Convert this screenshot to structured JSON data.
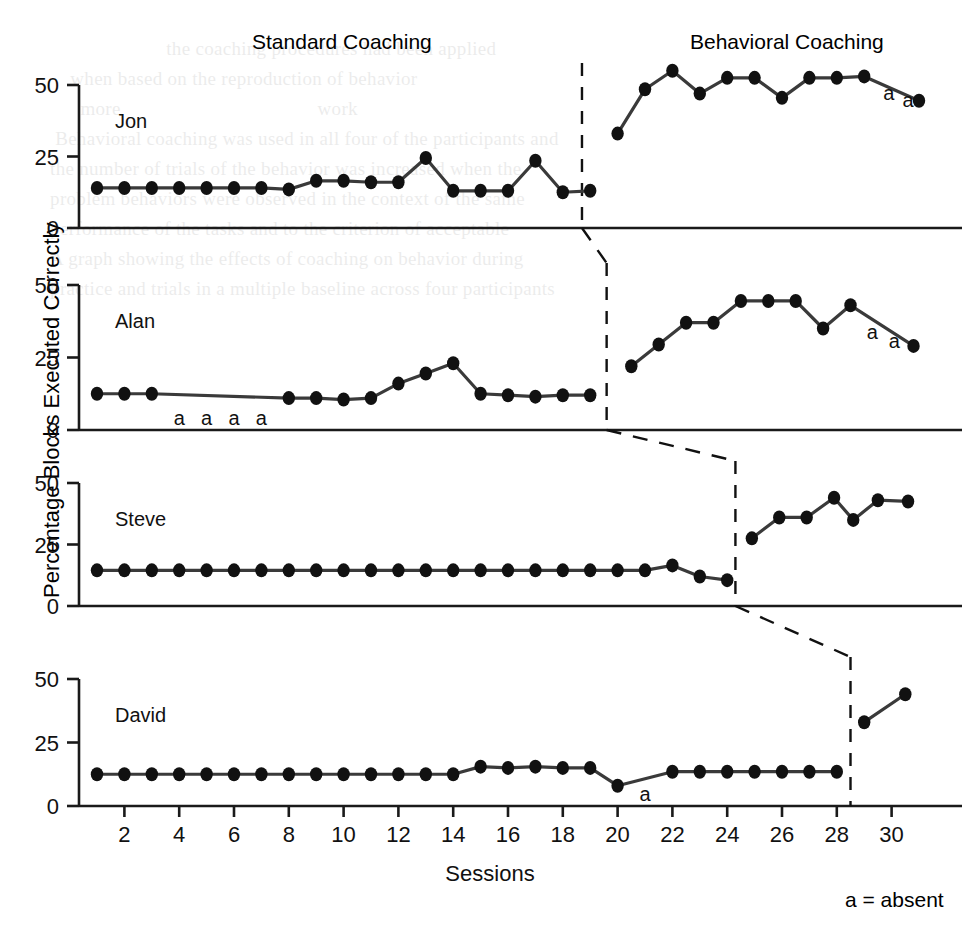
{
  "figure": {
    "phase_labels": [
      {
        "text": "Standard Coaching",
        "x": 310,
        "y": 42
      },
      {
        "text": "Behavioral Coaching",
        "x": 700,
        "y": 42
      }
    ],
    "y_axis_title": "Percentage Blocks Executed Correctly",
    "x_axis_title": "Sessions",
    "legend_note": "a = absent",
    "absent_glyph": "a"
  },
  "chart_data": {
    "type": "line",
    "subtitle": "Multiple-baseline design: Standard Coaching vs Behavioral Coaching",
    "xlabel": "Sessions",
    "ylabel": "Percentage Blocks Executed Correctly",
    "xlim": [
      1,
      31
    ],
    "ylim": [
      0,
      57
    ],
    "yticks": [
      0,
      25,
      50
    ],
    "xticks": [
      2,
      4,
      6,
      8,
      10,
      12,
      14,
      16,
      18,
      20,
      22,
      24,
      26,
      28,
      30
    ],
    "grid": false,
    "legend_position": "bottom-right",
    "annotations": [
      {
        "label": "Standard Coaching",
        "phase": "baseline"
      },
      {
        "label": "Behavioral Coaching",
        "phase": "intervention"
      },
      {
        "label": "a = absent",
        "meaning": "session missed due to absence"
      }
    ],
    "panels": [
      {
        "name": "Jon",
        "phase_line_session": 18.7,
        "series": [
          {
            "name": "Standard Coaching",
            "points": [
              {
                "x": 1,
                "y": 14
              },
              {
                "x": 2,
                "y": 14
              },
              {
                "x": 3,
                "y": 14
              },
              {
                "x": 4,
                "y": 14
              },
              {
                "x": 5,
                "y": 14
              },
              {
                "x": 6,
                "y": 14
              },
              {
                "x": 7,
                "y": 14
              },
              {
                "x": 8,
                "y": 13.5
              },
              {
                "x": 9,
                "y": 16.5
              },
              {
                "x": 10,
                "y": 16.5
              },
              {
                "x": 11,
                "y": 16
              },
              {
                "x": 12,
                "y": 16
              },
              {
                "x": 13,
                "y": 24.5
              },
              {
                "x": 14,
                "y": 13
              },
              {
                "x": 15,
                "y": 13
              },
              {
                "x": 16,
                "y": 13
              },
              {
                "x": 17,
                "y": 23.5
              },
              {
                "x": 18,
                "y": 12.5
              },
              {
                "x": 19,
                "y": 13
              }
            ]
          },
          {
            "name": "Behavioral Coaching",
            "points": [
              {
                "x": 20,
                "y": 33
              },
              {
                "x": 21,
                "y": 48.5
              },
              {
                "x": 22,
                "y": 55
              },
              {
                "x": 23,
                "y": 47
              },
              {
                "x": 24,
                "y": 52.5
              },
              {
                "x": 25,
                "y": 52.5
              },
              {
                "x": 26,
                "y": 45.5
              },
              {
                "x": 27,
                "y": 52.5
              },
              {
                "x": 28,
                "y": 52.5
              },
              {
                "x": 29,
                "y": 53
              },
              {
                "x": 31,
                "y": 44.5
              }
            ]
          }
        ],
        "absences": [
          {
            "x": 29.9,
            "y": 47.5
          },
          {
            "x": 30.6,
            "y": 45
          }
        ]
      },
      {
        "name": "Alan",
        "phase_line_session": 19.6,
        "series": [
          {
            "name": "Standard Coaching",
            "points": [
              {
                "x": 1,
                "y": 12.5
              },
              {
                "x": 2,
                "y": 12.5
              },
              {
                "x": 3,
                "y": 12.5
              },
              {
                "x": 8,
                "y": 11
              },
              {
                "x": 9,
                "y": 11
              },
              {
                "x": 10,
                "y": 10.5
              },
              {
                "x": 11,
                "y": 11
              },
              {
                "x": 12,
                "y": 16
              },
              {
                "x": 13,
                "y": 19.5
              },
              {
                "x": 14,
                "y": 23
              },
              {
                "x": 15,
                "y": 12.5
              },
              {
                "x": 16,
                "y": 12
              },
              {
                "x": 17,
                "y": 11.5
              },
              {
                "x": 18,
                "y": 12
              },
              {
                "x": 19,
                "y": 12
              }
            ]
          },
          {
            "name": "Behavioral Coaching",
            "points": [
              {
                "x": 20.5,
                "y": 22
              },
              {
                "x": 21.5,
                "y": 29.5
              },
              {
                "x": 22.5,
                "y": 37
              },
              {
                "x": 23.5,
                "y": 37
              },
              {
                "x": 24.5,
                "y": 44.5
              },
              {
                "x": 25.5,
                "y": 44.5
              },
              {
                "x": 26.5,
                "y": 44.5
              },
              {
                "x": 27.5,
                "y": 35
              },
              {
                "x": 28.5,
                "y": 43
              },
              {
                "x": 30.8,
                "y": 29
              }
            ]
          }
        ],
        "absences": [
          {
            "x": 4,
            "y": 4.5
          },
          {
            "x": 5,
            "y": 4.5
          },
          {
            "x": 6,
            "y": 4.5
          },
          {
            "x": 7,
            "y": 4.5
          },
          {
            "x": 29.3,
            "y": 34
          },
          {
            "x": 30.1,
            "y": 31
          }
        ]
      },
      {
        "name": "Steve",
        "phase_line_session": 24.3,
        "series": [
          {
            "name": "Standard Coaching",
            "points": [
              {
                "x": 1,
                "y": 14.5
              },
              {
                "x": 2,
                "y": 14.5
              },
              {
                "x": 3,
                "y": 14.5
              },
              {
                "x": 4,
                "y": 14.5
              },
              {
                "x": 5,
                "y": 14.5
              },
              {
                "x": 6,
                "y": 14.5
              },
              {
                "x": 7,
                "y": 14.5
              },
              {
                "x": 8,
                "y": 14.5
              },
              {
                "x": 9,
                "y": 14.5
              },
              {
                "x": 10,
                "y": 14.5
              },
              {
                "x": 11,
                "y": 14.5
              },
              {
                "x": 12,
                "y": 14.5
              },
              {
                "x": 13,
                "y": 14.5
              },
              {
                "x": 14,
                "y": 14.5
              },
              {
                "x": 15,
                "y": 14.5
              },
              {
                "x": 16,
                "y": 14.5
              },
              {
                "x": 17,
                "y": 14.5
              },
              {
                "x": 18,
                "y": 14.5
              },
              {
                "x": 19,
                "y": 14.5
              },
              {
                "x": 20,
                "y": 14.5
              },
              {
                "x": 21,
                "y": 14.5
              },
              {
                "x": 22,
                "y": 16.5
              },
              {
                "x": 23,
                "y": 12
              },
              {
                "x": 24,
                "y": 10.5
              }
            ]
          },
          {
            "name": "Behavioral Coaching",
            "points": [
              {
                "x": 24.9,
                "y": 27.5
              },
              {
                "x": 25.9,
                "y": 36
              },
              {
                "x": 26.9,
                "y": 36
              },
              {
                "x": 27.9,
                "y": 44
              },
              {
                "x": 28.6,
                "y": 35
              },
              {
                "x": 29.5,
                "y": 43
              },
              {
                "x": 30.6,
                "y": 42.5
              }
            ]
          }
        ],
        "absences": []
      },
      {
        "name": "David",
        "phase_line_session": 28.5,
        "series": [
          {
            "name": "Standard Coaching",
            "points": [
              {
                "x": 1,
                "y": 12.5
              },
              {
                "x": 2,
                "y": 12.5
              },
              {
                "x": 3,
                "y": 12.5
              },
              {
                "x": 4,
                "y": 12.5
              },
              {
                "x": 5,
                "y": 12.5
              },
              {
                "x": 6,
                "y": 12.5
              },
              {
                "x": 7,
                "y": 12.5
              },
              {
                "x": 8,
                "y": 12.5
              },
              {
                "x": 9,
                "y": 12.5
              },
              {
                "x": 10,
                "y": 12.5
              },
              {
                "x": 11,
                "y": 12.5
              },
              {
                "x": 12,
                "y": 12.5
              },
              {
                "x": 13,
                "y": 12.5
              },
              {
                "x": 14,
                "y": 12.5
              },
              {
                "x": 15,
                "y": 15.5
              },
              {
                "x": 16,
                "y": 15
              },
              {
                "x": 17,
                "y": 15.5
              },
              {
                "x": 18,
                "y": 15
              },
              {
                "x": 19,
                "y": 15
              },
              {
                "x": 20,
                "y": 8
              },
              {
                "x": 22,
                "y": 13.5
              },
              {
                "x": 23,
                "y": 13.5
              },
              {
                "x": 24,
                "y": 13.5
              },
              {
                "x": 25,
                "y": 13.5
              },
              {
                "x": 26,
                "y": 13.5
              },
              {
                "x": 27,
                "y": 13.5
              },
              {
                "x": 28,
                "y": 13.5
              }
            ]
          },
          {
            "name": "Behavioral Coaching",
            "points": [
              {
                "x": 29,
                "y": 33
              },
              {
                "x": 30.5,
                "y": 44
              }
            ]
          }
        ],
        "absences": [
          {
            "x": 21,
            "y": 5
          }
        ]
      }
    ]
  },
  "bleed_text": "                                                                                                                                                        \n                         the coaching procedures had been applied                                                                                        \n      when based on the reproduction of behavior                                                                                                         \n        more                                       work                                                                                                  \n   Behavioral coaching was used in all four of the participants and                                                                                      \n  the number of trials of the behavior was increased when the                                                                                            \n  problem behaviors were observed in the context of the same                                                                                             \n  performance of the tasks and to the criterion of acceptable                                                                                            \n  A graph showing the effects of coaching on behavior during                                                                                              \n  practice and trials in a multiple baseline across four participants"
}
